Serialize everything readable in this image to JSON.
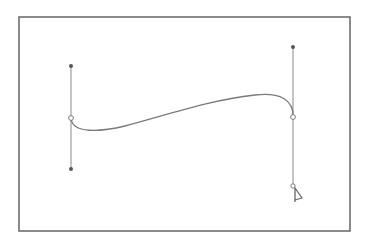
{
  "figure": {
    "colors": {
      "background": "#ffffff",
      "frame": "#6e6e6e",
      "path": "#7a7a7a",
      "handle_line": "#8a8a8a",
      "handle_point": "#555555",
      "anchor_fill": "#ffffff",
      "anchor_stroke": "#7a7a7a",
      "cursor": "#666666"
    },
    "frame": {
      "x": 19,
      "y": 17,
      "width": 331,
      "height": 214
    },
    "anchors": [
      {
        "name": "left-anchor",
        "x": 71,
        "y": 118,
        "handle_in": {
          "x": 71,
          "y": 169
        },
        "handle_out": {
          "x": 71,
          "y": 66
        }
      },
      {
        "name": "right-anchor",
        "x": 293,
        "y": 117,
        "handle_in": {
          "x": 293,
          "y": 47
        },
        "handle_out": {
          "x": 293,
          "y": 186
        }
      }
    ],
    "curve": {
      "d": "M71,118 C72,134 100,132 125,126 C170,114 210,100 255,95 C280,92 294,100 293,117"
    },
    "cursor": {
      "type": "pen-tool-cursor",
      "x": 294,
      "y": 186
    }
  }
}
